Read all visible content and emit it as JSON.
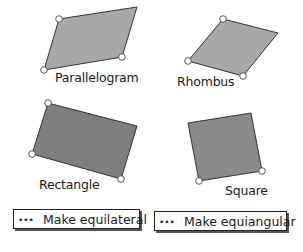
{
  "shapes": [
    {
      "id": "parallelogram",
      "label": "Parallelogram",
      "fill": "#a8a8a8"
    },
    {
      "id": "rhombus",
      "label": "Rhombus",
      "fill": "#a8a8a8"
    },
    {
      "id": "rectangle",
      "label": "Rectangle",
      "fill": "#7e7e7e"
    },
    {
      "id": "square",
      "label": "Square",
      "fill": "#8a8a8a"
    }
  ],
  "buttons": {
    "equilateral": {
      "icon": "•••",
      "label": "Make equilateral"
    },
    "equiangular": {
      "icon": "•••",
      "label": "Make equiangular"
    }
  }
}
